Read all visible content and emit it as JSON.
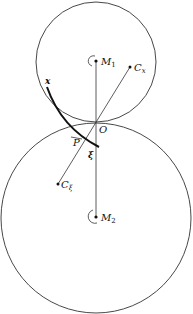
{
  "diagram": {
    "colors": {
      "stroke": "#222222",
      "background": "#ffffff"
    },
    "circles": {
      "top": {
        "cx": 96,
        "cy": 62,
        "r": 60
      },
      "bottom": {
        "cx": 96,
        "cy": 218,
        "r": 95
      }
    },
    "points": {
      "M1": {
        "x": 96,
        "y": 61
      },
      "M2": {
        "x": 96,
        "y": 217
      },
      "Cx": {
        "x": 130,
        "y": 67
      },
      "Cxi": {
        "x": 58,
        "y": 184
      },
      "O": {
        "x": 96,
        "y": 122
      }
    },
    "labels": {
      "M1": "M",
      "M1_sub": "1",
      "M2": "M",
      "M2_sub": "2",
      "Cx": "C",
      "Cx_sub": "x",
      "Cxi": "C",
      "Cxi_sub": "ξ",
      "O": "O",
      "P": "P",
      "x": "x",
      "xi": "ξ"
    }
  }
}
